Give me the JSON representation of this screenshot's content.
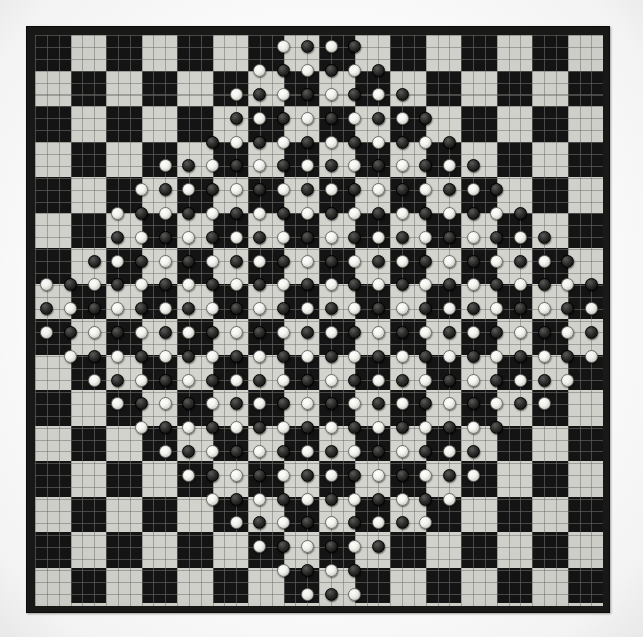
{
  "scene": {
    "title": "Checkerboard with game pieces",
    "description": "Photograph of a square 16x16 checkered game board overlaid with a fine millimetre grid, covered with small round black and white playing pieces arranged in a dense diamond-shaped cluster.",
    "background_color": "#fefefe"
  },
  "board": {
    "name": "checkerboard",
    "columns": 16,
    "rows": 16,
    "square_size_px": 35.5,
    "dark_square_color": "#141414",
    "light_square_color": "#d4d4cf",
    "frame_color": "#191917",
    "frame_width_px": 8,
    "grid": {
      "visible": true,
      "cells_per_square": 3,
      "cell_size_px": 11.84,
      "line_color": "#5a5a56"
    },
    "origin_dark_square": "top-left"
  },
  "pieces": {
    "white_color": "#f2f2ee",
    "black_color": "#1a1a19",
    "diameter_px": 13,
    "lattice_spacing_px": 23.7,
    "white_count": 134,
    "black_count": 134,
    "total_count": 268,
    "arrangement": "diamond-cluster",
    "lattice": {
      "cols": 24,
      "rows": 24,
      "x0": 11.84,
      "y0": 11.9,
      "dx": 23.68,
      "dy": 23.8
    },
    "diamond": {
      "center_col": 11.5,
      "center_row": 11.5,
      "radius": 13.2,
      "inner_hole": 0
    }
  },
  "legend": {
    "white_piece_label": "White piece",
    "black_piece_label": "Black piece",
    "dark_square_label": "Dark square",
    "light_square_label": "Light square"
  }
}
